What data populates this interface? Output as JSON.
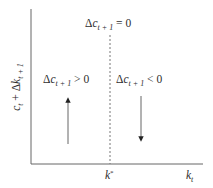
{
  "diagram": {
    "type": "phase-diagram",
    "y_axis": {
      "label_main": "c",
      "label_main_sub": "t",
      "label_op": " + Δ",
      "label_k": "k",
      "label_k_sub": "t + 1"
    },
    "x_axis": {
      "label": "k",
      "label_sub": "t"
    },
    "steady_state": {
      "tick_label": "k",
      "tick_label_sup": "*"
    },
    "locus": {
      "prefix": "Δ",
      "var": "c",
      "sub": "t + 1",
      "relation": " = 0"
    },
    "left_region": {
      "prefix": "Δ",
      "var": "c",
      "sub": "t + 1",
      "relation": " > 0",
      "arrow_direction": "up"
    },
    "right_region": {
      "prefix": "Δ",
      "var": "c",
      "sub": "t + 1",
      "relation": " < 0",
      "arrow_direction": "down"
    },
    "colors": {
      "axis": "#555555",
      "dashed_line": "#777777",
      "arrow": "#444444",
      "text": "#2e2e2e"
    }
  }
}
